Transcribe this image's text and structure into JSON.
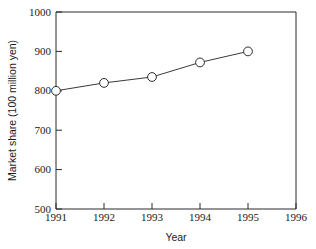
{
  "chart_data": {
    "type": "line",
    "title": "",
    "subtitle": "",
    "xlabel": "Year",
    "ylabel": "Market share (100 million yen)",
    "x": [
      1991,
      1992,
      1993,
      1994,
      1995
    ],
    "values": [
      800,
      820,
      835,
      872,
      900
    ],
    "series": [
      {
        "name": "Market share",
        "values": [
          800,
          820,
          835,
          872,
          900
        ]
      }
    ],
    "xlim": [
      1991,
      1996
    ],
    "ylim": [
      500,
      1000
    ],
    "xticks": [
      1991,
      1992,
      1993,
      1994,
      1995,
      1996
    ],
    "xticklabels": [
      "1991",
      "1992",
      "1993",
      "1994",
      "1995",
      "1996"
    ],
    "yticks": [
      500,
      600,
      700,
      800,
      900,
      1000
    ],
    "yticklabels": [
      "500",
      "600",
      "700",
      "800",
      "900",
      "1000"
    ],
    "grid": false,
    "legend": false,
    "legend_position": "none",
    "marker": "open-circle",
    "line_color": "#3a3a3a",
    "marker_face_color": "#ffffff",
    "marker_edge_color": "#2b2b2b",
    "background_color": "#ffffff",
    "annotations": []
  },
  "axes": {
    "y_tick_0": "500",
    "y_tick_1": "600",
    "y_tick_2": "700",
    "y_tick_3": "800",
    "y_tick_4": "900",
    "y_tick_5": "1000",
    "x_tick_0": "1991",
    "x_tick_1": "1992",
    "x_tick_2": "1993",
    "x_tick_3": "1994",
    "x_tick_4": "1995",
    "x_tick_5": "1996",
    "x_title": "Year",
    "y_title": "Market share (100 million yen)"
  }
}
